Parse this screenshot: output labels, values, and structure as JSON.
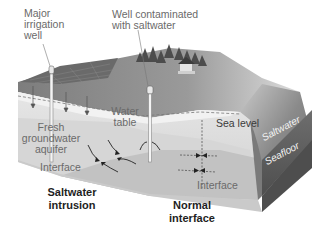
{
  "figure": {
    "type": "block diagram",
    "style": "grayscale"
  },
  "labels": {
    "major_irrigation_well": [
      "Major",
      "irrigation",
      "well"
    ],
    "well_contaminated": [
      "Well contaminated",
      "with saltwater"
    ],
    "fresh_aquifer": [
      "Fresh",
      "groundwater",
      "aquifer"
    ],
    "water_table": [
      "Water",
      "table"
    ],
    "interface_left": "Interface",
    "interface_right": "Interface",
    "sea_level": "Sea level",
    "saltwater": "Saltwater",
    "seafloor": "Seafloor",
    "saltwater_intrusion": [
      "Saltwater",
      "intrusion"
    ],
    "normal_interface": [
      "Normal",
      "interface"
    ]
  },
  "colors": {
    "ground_surface": "#8a8a8a",
    "field_dark": "#6e6e6e",
    "trees": "#4a4a4a",
    "aquifer_fresh": "#d9d9d9",
    "saltwater_wedge": "#bdbdbd",
    "sea_slope": "#7c7c7c",
    "block_side": "#5e5e5e",
    "label_gray": "#6a6a6a",
    "label_dark": "#1e1e1e"
  }
}
